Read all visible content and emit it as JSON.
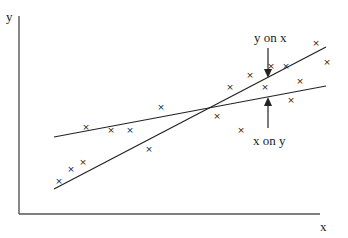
{
  "diagram": {
    "title": "",
    "axes": {
      "x_label": "x",
      "y_label": "y",
      "origin": [
        19,
        214
      ],
      "x_end": [
        320,
        214
      ],
      "y_end": [
        19,
        16
      ]
    },
    "lines": [
      {
        "name": "y on x",
        "from": [
          54,
          189
        ],
        "to": [
          326,
          47
        ]
      },
      {
        "name": "x on y",
        "from": [
          54,
          137
        ],
        "to": [
          326,
          86
        ]
      }
    ],
    "annotations": [
      {
        "label": "y on x",
        "arrow": "down",
        "arrow_x": 268,
        "arrow_from_y": 48,
        "arrow_to_y": 78
      },
      {
        "label": "x on y",
        "arrow": "up",
        "arrow_x": 268,
        "arrow_from_y": 128,
        "arrow_to_y": 97
      }
    ],
    "points": [
      [
        59,
        181
      ],
      [
        71,
        169
      ],
      [
        83,
        162
      ],
      [
        86,
        127
      ],
      [
        111,
        130
      ],
      [
        130,
        130
      ],
      [
        149,
        149
      ],
      [
        161,
        107
      ],
      [
        217,
        116
      ],
      [
        230,
        87
      ],
      [
        241,
        130
      ],
      [
        250,
        75
      ],
      [
        265,
        87
      ],
      [
        271,
        66
      ],
      [
        286,
        66
      ],
      [
        291,
        100
      ],
      [
        300,
        81
      ],
      [
        316,
        43
      ],
      [
        327,
        62
      ]
    ],
    "marker": "×",
    "colors": {
      "ink": "#222222",
      "background": "#ffffff"
    }
  }
}
